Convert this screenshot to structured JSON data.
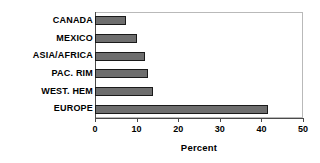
{
  "chart_data": {
    "type": "bar",
    "orientation": "horizontal",
    "title": "",
    "xlabel": "Percent",
    "ylabel": "",
    "categories": [
      "CANADA",
      "MEXICO",
      "ASIA/AFRICA",
      "PAC. RIM",
      "WEST. HEM",
      "EUROPE"
    ],
    "values": [
      7.5,
      10,
      12,
      12.7,
      14,
      41.5
    ],
    "xlim": [
      0,
      50
    ],
    "xticks": [
      0,
      10,
      20,
      30,
      40,
      50
    ],
    "xtick_labels": [
      "0",
      "10",
      "20",
      "30",
      "40",
      "50"
    ],
    "grid": false,
    "legend": null,
    "series": [
      {
        "name": "Percent",
        "values": [
          7.5,
          10,
          12,
          12.7,
          14,
          41.5
        ]
      }
    ],
    "colors": {
      "bar_fill": "#6e6e6e",
      "bar_border": "#1a1a1a",
      "axis": "#4a4a4a",
      "frame": "#b9b9b9",
      "text": "#000000",
      "background": "#ffffff"
    }
  }
}
